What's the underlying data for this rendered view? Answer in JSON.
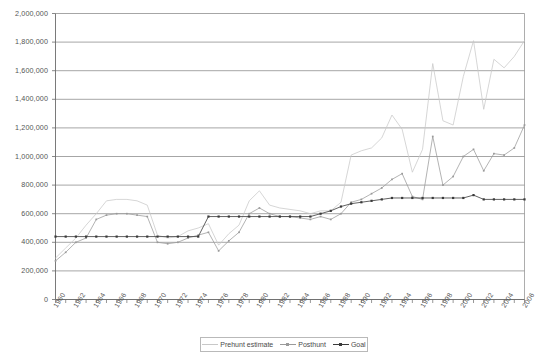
{
  "chart_data": {
    "type": "line",
    "title": "",
    "xlabel": "",
    "ylabel": "",
    "ylim": [
      0,
      2000000
    ],
    "ytick_step": 200000,
    "grid": true,
    "legend_position": "bottom",
    "ytick_labels": [
      "2,000,000",
      "1,800,000",
      "1,600,000",
      "1,400,000",
      "1,200,000",
      "1,000,000",
      "800,000",
      "600,000",
      "400,000",
      "200,000",
      "0"
    ],
    "ytick_values": [
      2000000,
      1800000,
      1600000,
      1400000,
      1200000,
      1000000,
      800000,
      600000,
      400000,
      200000,
      0
    ],
    "x": [
      1960,
      1961,
      1962,
      1963,
      1964,
      1965,
      1966,
      1967,
      1968,
      1969,
      1970,
      1971,
      1972,
      1973,
      1974,
      1975,
      1976,
      1977,
      1978,
      1979,
      1980,
      1981,
      1982,
      1983,
      1984,
      1985,
      1986,
      1987,
      1988,
      1989,
      1990,
      1991,
      1992,
      1993,
      1994,
      1995,
      1996,
      1997,
      1998,
      1999,
      2000,
      2001,
      2002,
      2003,
      2004,
      2005,
      2006
    ],
    "xtick_labels": [
      "1960",
      "1962",
      "1964",
      "1966",
      "1968",
      "1970",
      "1972",
      "1974",
      "1976",
      "1978",
      "1980",
      "1982",
      "1984",
      "1986",
      "1988",
      "1990",
      "1992",
      "1994",
      "1996",
      "1998",
      "2000",
      "2002",
      "2004",
      "2006"
    ],
    "xtick_values": [
      1960,
      1962,
      1964,
      1966,
      1968,
      1970,
      1972,
      1974,
      1976,
      1978,
      1980,
      1982,
      1984,
      1986,
      1988,
      1990,
      1992,
      1994,
      1996,
      1998,
      2000,
      2002,
      2004,
      2006
    ],
    "series": [
      {
        "name": "Prehunt estimate",
        "color": "#c8c8c8",
        "marker": "none",
        "values": [
          290000,
          360000,
          430000,
          520000,
          600000,
          690000,
          700000,
          700000,
          690000,
          660000,
          450000,
          430000,
          440000,
          480000,
          500000,
          530000,
          380000,
          460000,
          520000,
          690000,
          760000,
          660000,
          640000,
          630000,
          620000,
          600000,
          620000,
          620000,
          680000,
          1010000,
          1040000,
          1060000,
          1130000,
          1290000,
          1190000,
          890000,
          1050000,
          1650000,
          1250000,
          1220000,
          1560000,
          1810000,
          1330000,
          1680000,
          1620000,
          1700000,
          1810000
        ]
      },
      {
        "name": "Posthunt",
        "color": "#9a9a9a",
        "marker": "dot",
        "values": [
          270000,
          330000,
          400000,
          430000,
          560000,
          590000,
          600000,
          600000,
          590000,
          580000,
          400000,
          390000,
          400000,
          430000,
          450000,
          470000,
          340000,
          410000,
          470000,
          600000,
          640000,
          600000,
          580000,
          580000,
          570000,
          560000,
          580000,
          560000,
          600000,
          680000,
          700000,
          740000,
          780000,
          840000,
          880000,
          720000,
          700000,
          1140000,
          800000,
          860000,
          1000000,
          1050000,
          900000,
          1020000,
          1010000,
          1060000,
          1220000
        ]
      },
      {
        "name": "Goal",
        "color": "#3a3a3a",
        "marker": "dot",
        "values": [
          440000,
          440000,
          440000,
          440000,
          440000,
          440000,
          440000,
          440000,
          440000,
          440000,
          440000,
          440000,
          440000,
          440000,
          440000,
          580000,
          580000,
          580000,
          580000,
          580000,
          580000,
          580000,
          580000,
          580000,
          580000,
          580000,
          600000,
          620000,
          650000,
          670000,
          680000,
          690000,
          700000,
          710000,
          710000,
          710000,
          710000,
          710000,
          710000,
          710000,
          710000,
          730000,
          700000,
          700000,
          700000,
          700000,
          700000
        ]
      }
    ]
  },
  "legend": {
    "items": [
      {
        "label": "Prehunt estimate"
      },
      {
        "label": "Posthunt"
      },
      {
        "label": "Goal"
      }
    ]
  }
}
